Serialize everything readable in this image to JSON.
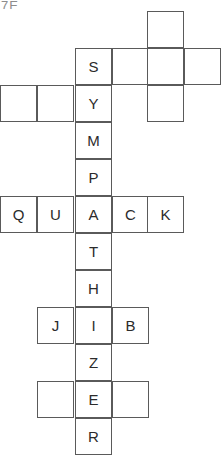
{
  "puzzle": {
    "title_fragment": "7E",
    "cell_size": 37,
    "colors": {
      "grid_line": "#5a5a5a",
      "cell_fill": "#ffffff",
      "letter": "#2b2b2b",
      "page_background": "#ffffff"
    },
    "words": {
      "vertical_main": "SYMPATHIZER",
      "horizontal_quack": "QUACK",
      "horizontal_jib": "JIB"
    },
    "cells": [
      {
        "name": "cell-r0-c3",
        "x": 147,
        "y": 11,
        "letter": ""
      },
      {
        "name": "cell-r1-c2",
        "x": 75,
        "y": 48,
        "letter": "S"
      },
      {
        "name": "cell-r1-c3",
        "x": 112,
        "y": 48,
        "letter": ""
      },
      {
        "name": "cell-r1-c4",
        "x": 147,
        "y": 48,
        "letter": ""
      },
      {
        "name": "cell-r1-c5",
        "x": 184,
        "y": 48,
        "letter": ""
      },
      {
        "name": "cell-r2-c0",
        "x": 0,
        "y": 85,
        "letter": ""
      },
      {
        "name": "cell-r2-c1",
        "x": 37,
        "y": 85,
        "letter": ""
      },
      {
        "name": "cell-r2-c2",
        "x": 75,
        "y": 85,
        "letter": "Y"
      },
      {
        "name": "cell-r2-c4",
        "x": 147,
        "y": 85,
        "letter": ""
      },
      {
        "name": "cell-r3-c2",
        "x": 75,
        "y": 122,
        "letter": "M"
      },
      {
        "name": "cell-r4-c2",
        "x": 75,
        "y": 159,
        "letter": "P"
      },
      {
        "name": "cell-r5-c0",
        "x": 0,
        "y": 196,
        "letter": "Q"
      },
      {
        "name": "cell-r5-c1",
        "x": 37,
        "y": 196,
        "letter": "U"
      },
      {
        "name": "cell-r5-c2",
        "x": 75,
        "y": 196,
        "letter": "A"
      },
      {
        "name": "cell-r5-c3",
        "x": 112,
        "y": 196,
        "letter": "C"
      },
      {
        "name": "cell-r5-c4",
        "x": 147,
        "y": 196,
        "letter": "K"
      },
      {
        "name": "cell-r6-c2",
        "x": 75,
        "y": 233,
        "letter": "T"
      },
      {
        "name": "cell-r7-c2",
        "x": 75,
        "y": 270,
        "letter": "H"
      },
      {
        "name": "cell-r8-c1",
        "x": 37,
        "y": 307,
        "letter": "J"
      },
      {
        "name": "cell-r8-c2",
        "x": 75,
        "y": 307,
        "letter": "I"
      },
      {
        "name": "cell-r8-c3",
        "x": 112,
        "y": 307,
        "letter": "B"
      },
      {
        "name": "cell-r9-c2",
        "x": 75,
        "y": 344,
        "letter": "Z"
      },
      {
        "name": "cell-r10-c1",
        "x": 37,
        "y": 381,
        "letter": ""
      },
      {
        "name": "cell-r10-c2",
        "x": 75,
        "y": 381,
        "letter": "E"
      },
      {
        "name": "cell-r10-c3",
        "x": 112,
        "y": 381,
        "letter": ""
      },
      {
        "name": "cell-r11-c2",
        "x": 75,
        "y": 418,
        "letter": "R"
      }
    ]
  }
}
